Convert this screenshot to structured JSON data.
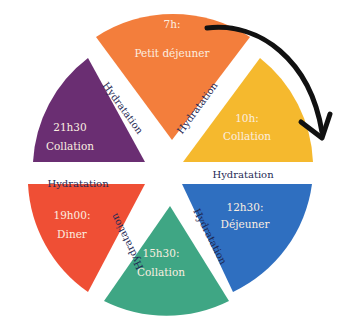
{
  "diagram": {
    "type": "meal-schedule-wheel",
    "direction": "clockwise",
    "segments": [
      {
        "time": "7h:",
        "meal": "Petit déjeuner",
        "color": "#f37e3c"
      },
      {
        "time": "10h:",
        "meal": "Collation",
        "color": "#f5b92e"
      },
      {
        "time": "12h30:",
        "meal": "Déjeuner",
        "color": "#2f6fc0"
      },
      {
        "time": "15h30:",
        "meal": "Collation",
        "color": "#3fa684"
      },
      {
        "time": "19h00:",
        "meal": "Diner",
        "color": "#ef4f35"
      },
      {
        "time": "21h30",
        "meal": "Collation",
        "color": "#6a2e72"
      }
    ],
    "separators": [
      {
        "label": "Hydratation"
      },
      {
        "label": "Hydratation"
      },
      {
        "label": "Hydratation"
      },
      {
        "label": "Hydratation"
      },
      {
        "label": "Hydratation"
      }
    ],
    "arrow_color": "#111111",
    "separator_text_color": "#1f2a55"
  }
}
